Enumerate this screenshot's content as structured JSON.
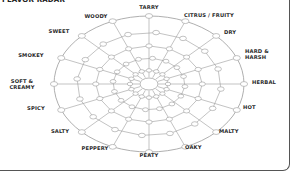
{
  "title": "FLAVOR RADAR",
  "radar": {
    "center": [
      149,
      84
    ],
    "radius_x": 95,
    "radius_y": 68,
    "rings": 5,
    "line_color": "#9a9a9a",
    "node_fill": "#ffffff",
    "axes": [
      {
        "id": "tarry",
        "label": "TARRY",
        "lines": [
          "TARRY"
        ],
        "lx": 149,
        "ly": 9,
        "anchor": "middle"
      },
      {
        "id": "citrus-fruity",
        "label": "CITRUS / FRUITY",
        "lines": [
          "CITRUS / FRUITY"
        ],
        "lx": 209,
        "ly": 17,
        "anchor": "middle"
      },
      {
        "id": "dry",
        "label": "DRY",
        "lines": [
          "DRY"
        ],
        "lx": 224,
        "ly": 34,
        "anchor": "start"
      },
      {
        "id": "hard-harsh",
        "label": "HARD & HARSH",
        "lines": [
          "HARD &",
          "HARSH"
        ],
        "lx": 245,
        "ly": 53,
        "anchor": "start"
      },
      {
        "id": "herbal",
        "label": "HERBAL",
        "lines": [
          "HERBAL"
        ],
        "lx": 252,
        "ly": 84,
        "anchor": "start"
      },
      {
        "id": "hot",
        "label": "HOT",
        "lines": [
          "HOT"
        ],
        "lx": 243,
        "ly": 109,
        "anchor": "start"
      },
      {
        "id": "malty",
        "label": "MALTY",
        "lines": [
          "MALTY"
        ],
        "lx": 219,
        "ly": 133,
        "anchor": "start"
      },
      {
        "id": "oaky",
        "label": "OAKY",
        "lines": [
          "OAKY"
        ],
        "lx": 185,
        "ly": 149,
        "anchor": "start"
      },
      {
        "id": "peaty",
        "label": "PEATY",
        "lines": [
          "PEATY"
        ],
        "lx": 149,
        "ly": 157,
        "anchor": "middle"
      },
      {
        "id": "peppery",
        "label": "PEPPERY",
        "lines": [
          "PEPPERY"
        ],
        "lx": 95,
        "ly": 150,
        "anchor": "middle"
      },
      {
        "id": "salty",
        "label": "SALTY",
        "lines": [
          "SALTY"
        ],
        "lx": 60,
        "ly": 133,
        "anchor": "middle"
      },
      {
        "id": "spicy",
        "label": "SPICY",
        "lines": [
          "SPICY"
        ],
        "lx": 36,
        "ly": 110,
        "anchor": "middle"
      },
      {
        "id": "soft-creamy",
        "label": "SOFT & CREAMY",
        "lines": [
          "SOFT &",
          "CREAMY"
        ],
        "lx": 22,
        "ly": 83,
        "anchor": "middle"
      },
      {
        "id": "smokey",
        "label": "SMOKEY",
        "lines": [
          "SMOKEY"
        ],
        "lx": 31,
        "ly": 57,
        "anchor": "middle"
      },
      {
        "id": "sweet",
        "label": "SWEET",
        "lines": [
          "SWEET"
        ],
        "lx": 59,
        "ly": 33,
        "anchor": "middle"
      },
      {
        "id": "woody",
        "label": "WOODY",
        "lines": [
          "WOODY"
        ],
        "lx": 96,
        "ly": 18,
        "anchor": "middle"
      }
    ]
  }
}
